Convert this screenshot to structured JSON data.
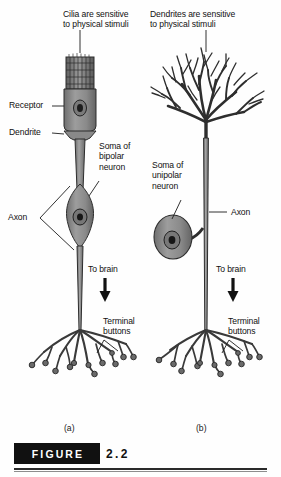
{
  "figure": {
    "caption_word": "FIGURE",
    "caption_number": "2.2"
  },
  "panels": [
    {
      "id": "a",
      "letter": "(a)",
      "neuron_type": "bipolar",
      "labels": [
        {
          "name": "cilia-note",
          "text": "Cilia are sensitive\nto physical stimuli"
        },
        {
          "name": "receptor",
          "text": "Receptor"
        },
        {
          "name": "dendrite",
          "text": "Dendrite"
        },
        {
          "name": "soma-bipolar",
          "text": "Soma of\nbipolar\nneuron"
        },
        {
          "name": "axon",
          "text": "Axon"
        },
        {
          "name": "to-brain",
          "text": "To brain"
        },
        {
          "name": "terminal-buttons",
          "text": "Terminal\nbuttons"
        }
      ]
    },
    {
      "id": "b",
      "letter": "(b)",
      "neuron_type": "unipolar",
      "labels": [
        {
          "name": "dendrites-note",
          "text": "Dendrites are sensitive\nto physical stimuli"
        },
        {
          "name": "soma-unipolar",
          "text": "Soma of\nunipolar\nneuron"
        },
        {
          "name": "axon",
          "text": "Axon"
        },
        {
          "name": "to-brain",
          "text": "To brain"
        },
        {
          "name": "terminal-buttons",
          "text": "Terminal\nbuttons"
        }
      ]
    }
  ],
  "colors": {
    "ink": "#111111",
    "cell_fill": "#8f8f8f",
    "cell_fill_light": "#a8a8a8",
    "cell_stroke": "#2d2d2d",
    "caption_bar": "#111111",
    "background": "#ffffff"
  }
}
